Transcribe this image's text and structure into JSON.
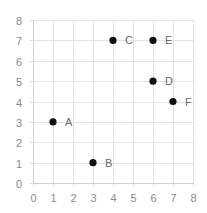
{
  "chart_data": {
    "type": "scatter",
    "title": "",
    "xlabel": "",
    "ylabel": "",
    "xlim": [
      0,
      8
    ],
    "ylim": [
      0,
      8
    ],
    "grid": true,
    "legend": null,
    "x_ticks": [
      "0",
      "1",
      "2",
      "3",
      "4",
      "5",
      "6",
      "7",
      "8"
    ],
    "y_ticks": [
      "0",
      "1",
      "2",
      "3",
      "4",
      "5",
      "6",
      "7",
      "8"
    ],
    "points": [
      {
        "label": "A",
        "x": 1,
        "y": 3
      },
      {
        "label": "B",
        "x": 3,
        "y": 1
      },
      {
        "label": "C",
        "x": 4,
        "y": 7
      },
      {
        "label": "D",
        "x": 6,
        "y": 5
      },
      {
        "label": "E",
        "x": 6,
        "y": 7
      },
      {
        "label": "F",
        "x": 7,
        "y": 4
      }
    ],
    "marker_color": "#111111"
  }
}
